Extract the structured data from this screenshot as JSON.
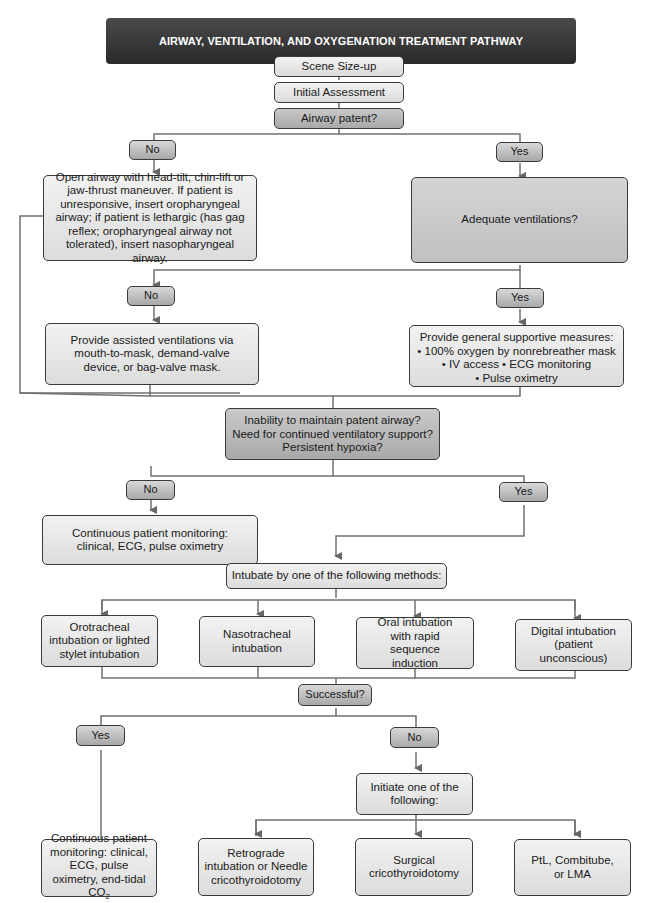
{
  "title": "AIRWAY, VENTILATION, AND OXYGENATION TREATMENT PATHWAY",
  "colors": {
    "title_bg": "#333333",
    "title_text": "#ffffff",
    "box_light": "#e6e6e6",
    "box_mid": "#b8b8b8",
    "line": "#666666"
  },
  "nodes": {
    "scene_sizeup": "Scene Size-up",
    "initial_assessment": "Initial Assessment",
    "airway_patent": "Airway patent?",
    "airway_no": "No",
    "airway_yes": "Yes",
    "open_airway": "Open airway with head-tilt, chin-lift or jaw-thrust maneuver. If patient is unresponsive, insert oropharyngeal airway; if patient is lethargic (has gag reflex; oropharyngeal airway not tolerated), insert nasopharyngeal airway.",
    "adequate_ventilations": "Adequate ventilations?",
    "vent_no": "No",
    "vent_yes": "Yes",
    "assisted_ventilations": "Provide assisted ventilations via mouth-to-mask, demand-valve device, or bag-valve mask.",
    "supportive": {
      "heading": "Provide general supportive measures:",
      "line1": "• 100% oxygen by nonrebreather mask",
      "line2": "• IV access • ECG monitoring",
      "line3": "• Pulse oximetry"
    },
    "inability": {
      "line1": "Inability to maintain patent airway?",
      "line2": "Need for continued ventilatory support?",
      "line3": "Persistent hypoxia?"
    },
    "inability_no": "No",
    "inability_yes": "Yes",
    "continuous_monitoring_1": "Continuous patient monitoring: clinical, ECG, pulse oximetry",
    "intubate": "Intubate by one of the following methods:",
    "methods": [
      "Orotracheal intubation or lighted stylet intubation",
      "Nasotracheal intubation",
      "Oral intubation with rapid sequence induction",
      "Digital intubation (patient unconscious)"
    ],
    "successful": "Successful?",
    "success_yes": "Yes",
    "success_no": "No",
    "continuous_monitoring_2": {
      "text": "Continuous patient monitoring: clinical, ECG, pulse oximetry, end-tidal CO",
      "sub": "2"
    },
    "initiate": "Initiate one of the following:",
    "alternatives": [
      "Retrograde intubation or Needle cricothyroidotomy",
      "Surgical cricothyroidotomy",
      "PtL, Combitube, or LMA"
    ]
  }
}
